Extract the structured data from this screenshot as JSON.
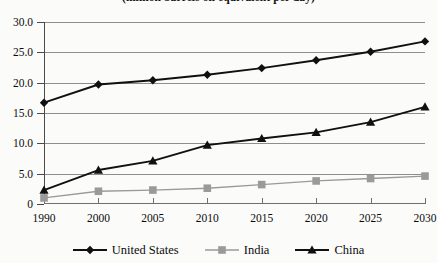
{
  "chart_data": {
    "type": "line",
    "title": "(million barrels oil equivalent per day)",
    "xlabel": "",
    "ylabel": "",
    "categories": [
      "1990",
      "2000",
      "2005",
      "2010",
      "2015",
      "2020",
      "2025",
      "2030"
    ],
    "ylim": [
      0,
      30
    ],
    "yticks": [
      "0",
      "5.0",
      "10.0",
      "15.0",
      "20.0",
      "25.0",
      "30.0"
    ],
    "ytick_values": [
      0,
      5,
      10,
      15,
      20,
      25,
      30
    ],
    "grid": true,
    "legend_position": "bottom",
    "series": [
      {
        "name": "United States",
        "marker": "diamond",
        "color": "#101010",
        "values": [
          16.7,
          19.7,
          20.4,
          21.3,
          22.4,
          23.7,
          25.1,
          26.8
        ]
      },
      {
        "name": "India",
        "marker": "square",
        "color": "#9a9a9a",
        "values": [
          1.0,
          2.1,
          2.3,
          2.6,
          3.2,
          3.8,
          4.2,
          4.6
        ]
      },
      {
        "name": "China",
        "marker": "triangle",
        "color": "#101010",
        "values": [
          2.3,
          5.6,
          7.1,
          9.7,
          10.8,
          11.8,
          13.5,
          16.0
        ]
      }
    ]
  }
}
